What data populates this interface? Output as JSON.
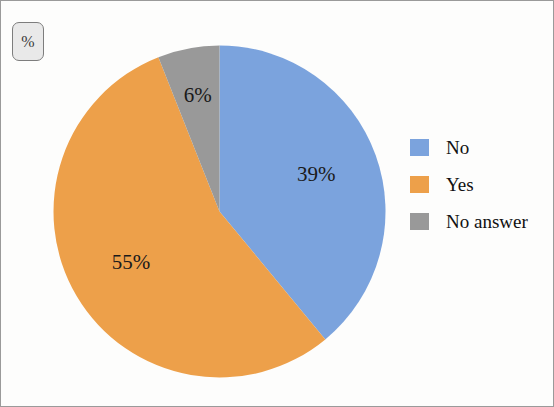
{
  "figure": {
    "badge_label": "%",
    "border_color": "#9a9a9a",
    "background_color": "#fdfdfc"
  },
  "chart_data": {
    "type": "pie",
    "title": "",
    "subtitle": "",
    "xlabel": "",
    "ylabel": "",
    "unit_label": "%",
    "start_angle_deg": 0,
    "direction": "clockwise",
    "grid": false,
    "legend_position": "right",
    "categories": [
      "No",
      "Yes",
      "No answer"
    ],
    "values": [
      39,
      55,
      6
    ],
    "data_labels": [
      "39%",
      "55%",
      "6%"
    ],
    "colors": [
      "#7ba3dd",
      "#eda04a",
      "#999999"
    ],
    "series": [
      {
        "name": "Response share",
        "values": [
          39,
          55,
          6
        ]
      }
    ],
    "slices": [
      {
        "label": "No",
        "value": 39,
        "data_label": "39%",
        "color": "#7ba3dd"
      },
      {
        "label": "Yes",
        "value": 55,
        "data_label": "55%",
        "color": "#eda04a"
      },
      {
        "label": "No answer",
        "value": 6,
        "data_label": "6%",
        "color": "#999999"
      }
    ]
  },
  "legend": {
    "items": [
      {
        "label": "No",
        "color": "#7ba3dd"
      },
      {
        "label": "Yes",
        "color": "#eda04a"
      },
      {
        "label": "No answer",
        "color": "#999999"
      }
    ]
  },
  "artifacts": {
    "bleed_text": [
      "",
      "",
      "",
      "",
      "",
      "",
      "",
      ""
    ]
  }
}
